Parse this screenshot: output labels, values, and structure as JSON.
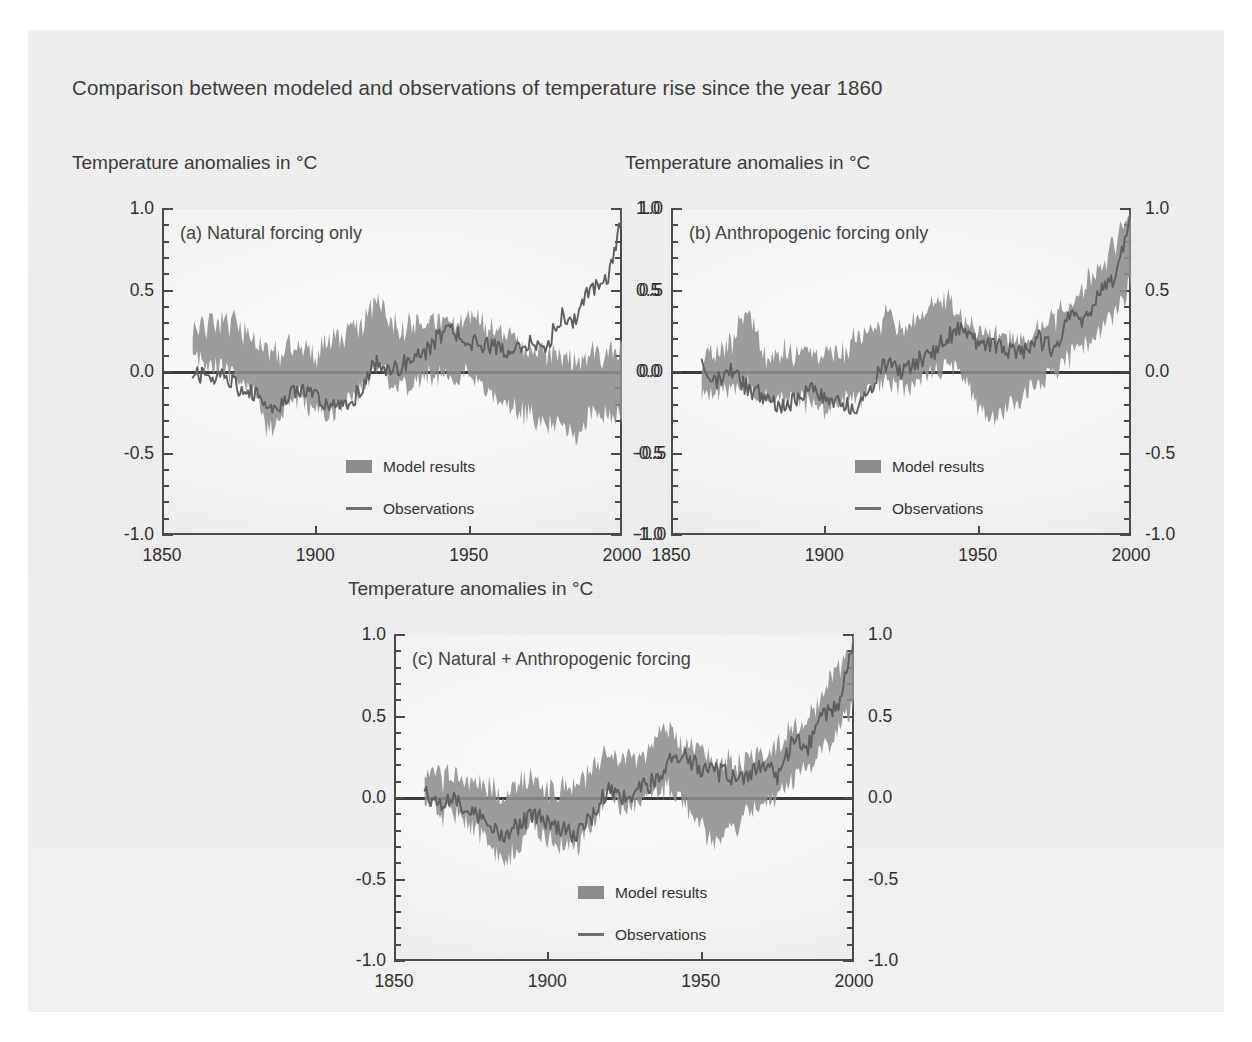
{
  "figure": {
    "title": "Comparison between modeled and observations of temperature rise since the year 1860",
    "background_color": "#e6e6e6",
    "band_color": "#8e8e8e",
    "observation_color": "#5f5f5f",
    "axis_color": "#4a4a4a"
  },
  "axis_title": "Temperature anomalies in °C",
  "legend": {
    "model_label": "Model results",
    "observations_label": "Observations"
  },
  "panels": [
    {
      "id": "a",
      "label": "(a) Natural forcing only"
    },
    {
      "id": "b",
      "label": "(b) Anthropogenic forcing only"
    },
    {
      "id": "c",
      "label": "(c) Natural + Anthropogenic forcing"
    }
  ],
  "chart_data": [
    {
      "type": "area",
      "title": "(a) Natural forcing only",
      "subtitle": "Temperature anomalies in °C",
      "xlabel": "",
      "ylabel": "Temperature anomalies in °C",
      "xlim": [
        1850,
        2000
      ],
      "ylim": [
        -1.0,
        1.0
      ],
      "xticks": [
        1850,
        1900,
        1950,
        2000
      ],
      "yticks": [
        -1.0,
        -0.5,
        0.0,
        0.5,
        1.0
      ],
      "ytick_labels": [
        "-1.0",
        "-0.5",
        "0.0",
        "0.5",
        "1.0"
      ],
      "minor_ticks_per_interval": 4,
      "grid": false,
      "legend_position": "inside-lower-center",
      "x": [
        1860,
        1865,
        1870,
        1875,
        1880,
        1885,
        1890,
        1895,
        1900,
        1905,
        1910,
        1915,
        1920,
        1925,
        1930,
        1935,
        1940,
        1945,
        1950,
        1955,
        1960,
        1965,
        1970,
        1975,
        1980,
        1985,
        1990,
        1995,
        2000
      ],
      "series": [
        {
          "name": "Model results",
          "kind": "band",
          "upper": [
            0.27,
            0.3,
            0.33,
            0.28,
            0.22,
            0.1,
            0.14,
            0.18,
            0.1,
            0.22,
            0.24,
            0.3,
            0.46,
            0.3,
            0.26,
            0.32,
            0.33,
            0.3,
            0.35,
            0.28,
            0.22,
            0.18,
            0.16,
            0.12,
            0.1,
            0.04,
            0.12,
            0.1,
            0.12
          ],
          "lower": [
            0.16,
            0.05,
            0.03,
            -0.02,
            -0.1,
            -0.36,
            -0.22,
            -0.14,
            -0.24,
            -0.26,
            -0.18,
            -0.1,
            0.04,
            -0.06,
            -0.08,
            -0.02,
            0.0,
            -0.04,
            0.02,
            -0.1,
            -0.16,
            -0.22,
            -0.26,
            -0.3,
            -0.32,
            -0.4,
            -0.22,
            -0.26,
            -0.24
          ]
        },
        {
          "name": "Observations",
          "kind": "line",
          "values": [
            0.02,
            -0.06,
            0.0,
            -0.1,
            -0.14,
            -0.22,
            -0.18,
            -0.1,
            -0.14,
            -0.2,
            -0.22,
            -0.1,
            0.06,
            0.0,
            0.06,
            0.1,
            0.22,
            0.26,
            0.18,
            0.16,
            0.14,
            0.12,
            0.2,
            0.14,
            0.34,
            0.32,
            0.52,
            0.56,
            0.95
          ]
        }
      ]
    },
    {
      "type": "area",
      "title": "(b) Anthropogenic forcing only",
      "subtitle": "Temperature anomalies in °C",
      "xlabel": "",
      "ylabel": "Temperature anomalies in °C",
      "xlim": [
        1850,
        2000
      ],
      "ylim": [
        -1.0,
        1.0
      ],
      "xticks": [
        1850,
        1900,
        1950,
        2000
      ],
      "yticks": [
        -1.0,
        -0.5,
        0.0,
        0.5,
        1.0
      ],
      "ytick_labels": [
        "-1.0",
        "-0.5",
        "0.0",
        "0.5",
        "1.0"
      ],
      "minor_ticks_per_interval": 4,
      "grid": false,
      "legend_position": "inside-lower-center",
      "x": [
        1860,
        1865,
        1870,
        1875,
        1880,
        1885,
        1890,
        1895,
        1900,
        1905,
        1910,
        1915,
        1920,
        1925,
        1930,
        1935,
        1940,
        1945,
        1950,
        1955,
        1960,
        1965,
        1970,
        1975,
        1980,
        1985,
        1990,
        1995,
        2000
      ],
      "series": [
        {
          "name": "Model results",
          "kind": "band",
          "upper": [
            0.08,
            0.12,
            0.16,
            0.42,
            0.1,
            0.14,
            0.12,
            0.1,
            0.08,
            0.12,
            0.2,
            0.26,
            0.34,
            0.26,
            0.3,
            0.42,
            0.46,
            0.34,
            0.26,
            0.22,
            0.18,
            0.2,
            0.26,
            0.3,
            0.44,
            0.52,
            0.66,
            0.8,
            0.95
          ],
          "lower": [
            -0.14,
            -0.12,
            -0.1,
            -0.06,
            -0.16,
            -0.14,
            -0.16,
            -0.18,
            -0.2,
            -0.18,
            -0.16,
            -0.1,
            -0.04,
            -0.08,
            -0.04,
            0.02,
            0.04,
            -0.02,
            -0.18,
            -0.3,
            -0.22,
            -0.14,
            -0.06,
            0.0,
            0.1,
            0.18,
            0.28,
            0.4,
            0.55
          ]
        },
        {
          "name": "Observations",
          "kind": "line",
          "values": [
            0.02,
            -0.06,
            0.0,
            -0.1,
            -0.14,
            -0.22,
            -0.18,
            -0.1,
            -0.14,
            -0.2,
            -0.22,
            -0.1,
            0.06,
            0.0,
            0.06,
            0.1,
            0.22,
            0.26,
            0.18,
            0.16,
            0.14,
            0.12,
            0.2,
            0.14,
            0.34,
            0.32,
            0.52,
            0.56,
            0.95
          ]
        }
      ]
    },
    {
      "type": "area",
      "title": "(c) Natural + Anthropogenic forcing",
      "subtitle": "Temperature anomalies in °C",
      "xlabel": "",
      "ylabel": "Temperature anomalies in °C",
      "xlim": [
        1850,
        2000
      ],
      "ylim": [
        -1.0,
        1.0
      ],
      "xticks": [
        1850,
        1900,
        1950,
        2000
      ],
      "yticks": [
        -1.0,
        -0.5,
        0.0,
        0.5,
        1.0
      ],
      "ytick_labels": [
        "-1.0",
        "-0.5",
        "0.0",
        "0.5",
        "1.0"
      ],
      "minor_ticks_per_interval": 4,
      "grid": false,
      "legend_position": "inside-lower-center",
      "x": [
        1860,
        1865,
        1870,
        1875,
        1880,
        1885,
        1890,
        1895,
        1900,
        1905,
        1910,
        1915,
        1920,
        1925,
        1930,
        1935,
        1940,
        1945,
        1950,
        1955,
        1960,
        1965,
        1970,
        1975,
        1980,
        1985,
        1990,
        1995,
        2000
      ],
      "series": [
        {
          "name": "Model results",
          "kind": "band",
          "upper": [
            0.18,
            0.12,
            0.14,
            0.1,
            0.06,
            0.02,
            0.1,
            0.12,
            0.06,
            0.04,
            0.1,
            0.18,
            0.28,
            0.24,
            0.26,
            0.36,
            0.44,
            0.3,
            0.28,
            0.22,
            0.22,
            0.22,
            0.28,
            0.32,
            0.42,
            0.5,
            0.64,
            0.78,
            0.95
          ],
          "lower": [
            0.0,
            -0.1,
            -0.08,
            -0.18,
            -0.26,
            -0.4,
            -0.3,
            -0.18,
            -0.24,
            -0.3,
            -0.28,
            -0.16,
            0.02,
            -0.06,
            -0.02,
            0.04,
            0.08,
            -0.04,
            -0.16,
            -0.28,
            -0.18,
            -0.1,
            -0.02,
            0.02,
            0.12,
            0.2,
            0.3,
            0.42,
            0.58
          ]
        },
        {
          "name": "Observations",
          "kind": "line",
          "values": [
            0.02,
            -0.06,
            0.0,
            -0.1,
            -0.14,
            -0.22,
            -0.18,
            -0.1,
            -0.14,
            -0.2,
            -0.22,
            -0.1,
            0.06,
            0.0,
            0.06,
            0.1,
            0.22,
            0.26,
            0.18,
            0.16,
            0.14,
            0.12,
            0.2,
            0.14,
            0.34,
            0.32,
            0.52,
            0.56,
            0.95
          ]
        }
      ]
    }
  ]
}
